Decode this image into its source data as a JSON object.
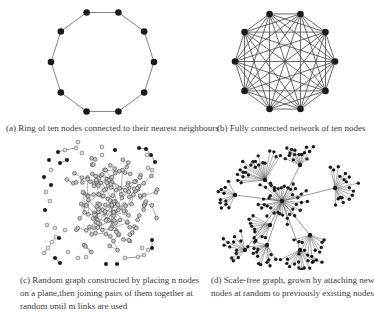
{
  "figure": {
    "panels": [
      {
        "id": "a",
        "caption": "(a) Ring of ten nodes connected to their nearest neighbours",
        "graph_type": "ring",
        "node_count": 10
      },
      {
        "id": "b",
        "caption": "(b) Fully connected network of ten nodes",
        "graph_type": "complete",
        "node_count": 10
      },
      {
        "id": "c",
        "caption_lines": [
          "(c) Random graph constructed by placing n nodes",
          "on a plane,then joining pairs of them together at",
          "random until m links are used"
        ],
        "graph_type": "random"
      },
      {
        "id": "d",
        "caption_lines": [
          "(d) Scale-free graph, grown by attaching new",
          "nodes at random to previously existing nodes"
        ],
        "graph_type": "scale-free"
      }
    ],
    "colors": {
      "node_dark": "#1a1a1a",
      "node_light": "#c8c8c8",
      "edge": "#555555"
    }
  }
}
